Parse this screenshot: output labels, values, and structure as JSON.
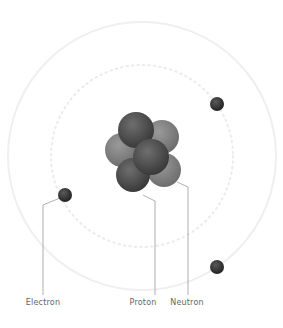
{
  "diagram": {
    "labels": {
      "electron": "Electron",
      "proton": "Proton",
      "neutron": "Neutron"
    },
    "colors": {
      "orbit": "#eeeeee",
      "proton": "#5a5a5a",
      "neutron": "#8a8a8a",
      "electron": "#3a3a3a",
      "leader": "#999999",
      "label": "#666666"
    },
    "electrons_count": 3
  }
}
